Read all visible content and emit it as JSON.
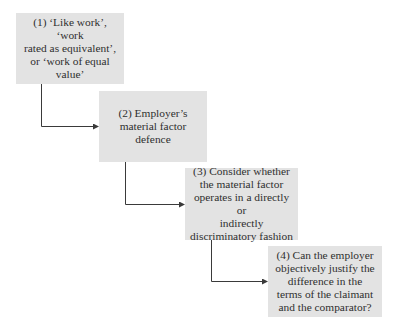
{
  "diagram": {
    "type": "stepped-flowchart",
    "colors": {
      "box_fill": "#e3e3e3",
      "text": "#2f2f2f",
      "connector": "#3a3a3a"
    },
    "steps": [
      {
        "number": "(1)",
        "label": "(1) ‘Like work’, ‘work rated as equivalent’, or ‘work of equal value’",
        "lines": [
          "(1) ‘Like work’, ‘work",
          "rated as equivalent’,",
          "or ‘work of equal",
          "value’"
        ]
      },
      {
        "number": "(2)",
        "label": "(2) Employer’s material factor defence",
        "lines": [
          "(2) Employer’s",
          "material factor",
          "defence"
        ]
      },
      {
        "number": "(3)",
        "label": "(3) Consider whether the material factor operates in a directly or indirectly discriminatory fashion",
        "lines": [
          "(3) Consider whether",
          "the material factor",
          "operates in a directly or",
          "indirectly",
          "discriminatory fashion"
        ]
      },
      {
        "number": "(4)",
        "label": "(4) Can the employer objectively justify the difference in the terms of the claimant and the comparator?",
        "lines": [
          "(4) Can the employer",
          "objectively justify the",
          "difference in the",
          "terms of the claimant",
          "and the comparator?"
        ]
      }
    ],
    "connectors": [
      {
        "from": "(1)",
        "to": "(2)"
      },
      {
        "from": "(2)",
        "to": "(3)"
      },
      {
        "from": "(3)",
        "to": "(4)"
      }
    ]
  }
}
